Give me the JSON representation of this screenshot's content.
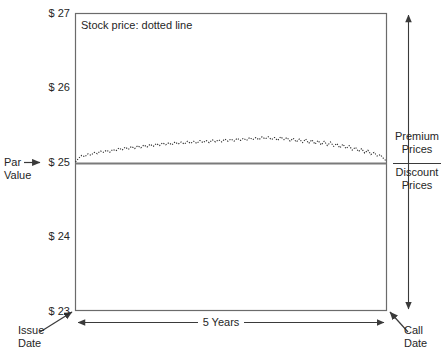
{
  "plot": {
    "title": "Stock price: dotted line"
  },
  "axes": {
    "y_ticks": [
      "$ 27",
      "$ 26",
      "$ 25",
      "$ 24",
      "$ 23"
    ],
    "x_span_label": "5 Years",
    "x_start_label_line1": "Issue",
    "x_start_label_line2": "Date",
    "x_end_label_line1": "Call",
    "x_end_label_line2": "Date"
  },
  "annotations": {
    "par_value_line1": "Par",
    "par_value_line2": "Value",
    "par_arrow": "→",
    "premium_line1": "Premium",
    "premium_line2": "Prices",
    "discount_line1": "Discount",
    "discount_line2": "Prices"
  },
  "colors": {
    "axis": "#6b6b6b",
    "par_line": "#7a7a7a",
    "price_line": "#2b2b2b",
    "text": "#262626",
    "background": "#ffffff"
  },
  "chart_data": {
    "type": "line",
    "title": "Stock price: dotted line",
    "xlabel": "5 Years",
    "ylabel": "",
    "ylim": [
      23,
      27
    ],
    "xlim": [
      0,
      5
    ],
    "y_tick_values": [
      27,
      26,
      25,
      24,
      23
    ],
    "y_tick_labels": [
      "$ 27",
      "$ 26",
      "$ 25",
      "$ 24",
      "$ 23"
    ],
    "grid": false,
    "legend": "Stock price: dotted line",
    "legend_position": "top-left-inside",
    "reference_lines": [
      {
        "name": "Par Value",
        "y": 25,
        "style": "solid",
        "color": "#7a7a7a"
      }
    ],
    "regions": [
      {
        "name": "Premium Prices",
        "above_y": 25
      },
      {
        "name": "Discount Prices",
        "below_y": 25
      }
    ],
    "series": [
      {
        "name": "Stock price",
        "style": "dotted",
        "color": "#2b2b2b",
        "x": [
          0.0,
          0.05,
          0.1,
          0.15,
          0.2,
          0.25,
          0.3,
          0.35,
          0.4,
          0.45,
          0.5,
          0.55,
          0.6,
          0.65,
          0.7,
          0.75,
          0.8,
          0.85,
          0.9,
          0.95,
          1.0,
          1.05,
          1.1,
          1.15,
          1.2,
          1.25,
          1.3,
          1.35,
          1.4,
          1.45,
          1.5,
          1.55,
          1.6,
          1.65,
          1.7,
          1.75,
          1.8,
          1.85,
          1.9,
          1.95,
          2.0,
          2.05,
          2.1,
          2.15,
          2.2,
          2.25,
          2.3,
          2.35,
          2.4,
          2.45,
          2.5,
          2.55,
          2.6,
          2.65,
          2.7,
          2.75,
          2.8,
          2.85,
          2.9,
          2.95,
          3.0,
          3.05,
          3.1,
          3.15,
          3.2,
          3.25,
          3.3,
          3.35,
          3.4,
          3.45,
          3.5,
          3.55,
          3.6,
          3.65,
          3.7,
          3.75,
          3.8,
          3.85,
          3.9,
          3.95,
          4.0,
          4.05,
          4.1,
          4.15,
          4.2,
          4.25,
          4.3,
          4.35,
          4.4,
          4.45,
          4.5,
          4.55,
          4.6,
          4.65,
          4.7,
          4.75,
          4.8,
          4.85,
          4.9,
          4.95,
          5.0
        ],
        "values": [
          25.0,
          25.05,
          25.09,
          25.07,
          25.11,
          25.09,
          25.13,
          25.11,
          25.15,
          25.13,
          25.16,
          25.13,
          25.17,
          25.15,
          25.19,
          25.16,
          25.2,
          25.17,
          25.21,
          25.18,
          25.22,
          25.19,
          25.23,
          25.2,
          25.24,
          25.21,
          25.25,
          25.22,
          25.26,
          25.23,
          25.26,
          25.23,
          25.27,
          25.24,
          25.27,
          25.24,
          25.28,
          25.25,
          25.28,
          25.25,
          25.29,
          25.26,
          25.29,
          25.26,
          25.3,
          25.27,
          25.3,
          25.27,
          25.31,
          25.28,
          25.31,
          25.28,
          25.32,
          25.29,
          25.32,
          25.29,
          25.33,
          25.3,
          25.33,
          25.3,
          25.34,
          25.31,
          25.34,
          25.3,
          25.33,
          25.29,
          25.34,
          25.3,
          25.33,
          25.28,
          25.32,
          25.27,
          25.31,
          25.26,
          25.31,
          25.25,
          25.3,
          25.24,
          25.29,
          25.23,
          25.28,
          25.22,
          25.27,
          25.21,
          25.25,
          25.19,
          25.24,
          25.18,
          25.22,
          25.16,
          25.2,
          25.14,
          25.18,
          25.12,
          25.16,
          25.1,
          25.13,
          25.08,
          25.1,
          25.05,
          25.01
        ]
      }
    ]
  }
}
